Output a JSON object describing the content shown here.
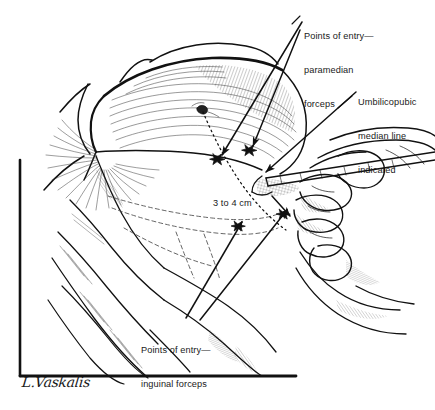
{
  "figure": {
    "kind": "medical-illustration",
    "technique": "pen-and-ink line drawing with hatching",
    "background_color": "#ffffff",
    "ink_color": "#111111",
    "frame": {
      "shape": "L-shaped border rule",
      "vertical_rule": "left edge, from y=160 to y=376 at x=20",
      "horizontal_rule": "bottom edge, from x=20 to x=296 at y=376"
    }
  },
  "labels": {
    "paramedian": {
      "line1": "Points of entry—",
      "line2": "paramedian",
      "line3": "forceps"
    },
    "umbilicopubic": {
      "line1": "Umbilicopubic",
      "line2": "median line",
      "line3": "indicated"
    },
    "measurement": {
      "text": "3 to 4 cm"
    },
    "inguinal": {
      "line1": "Points of entry—",
      "line2": "inguinal forceps"
    }
  },
  "signature": {
    "artist": "L.Vaskalis"
  },
  "annotations": {
    "entry_point_markers": 4,
    "dotted_line_name": "umbilicopubic median line",
    "arrow_count": 6
  }
}
